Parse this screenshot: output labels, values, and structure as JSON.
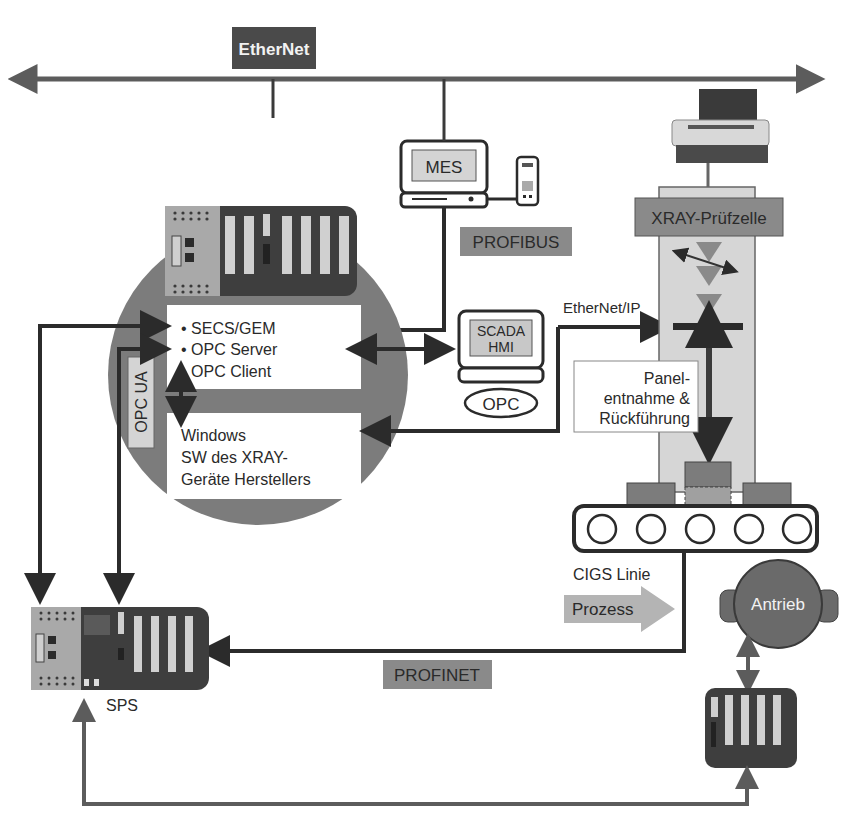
{
  "diagram": {
    "ethernet_label": "EtherNet",
    "mes_label": "MES",
    "profibus_label": "PROFIBUS",
    "xray_cell_label": "XRAY-Prüfzelle",
    "ethernet_ip_label": "EtherNet/IP",
    "scada_line1": "SCADA",
    "scada_line2": "HMI",
    "opc_label": "OPC",
    "opc_ua_label": "OPC UA",
    "software_items": [
      "• SECS/GEM",
      "• OPC Server",
      "• OPC Client"
    ],
    "windows_lines": [
      "Windows",
      "SW des XRAY-",
      "Geräte Herstellers"
    ],
    "panel_lines": [
      "Panel-",
      "entnahme &",
      "Rückführung"
    ],
    "cigs_label": "CIGS Linie",
    "prozess_label": "Prozess",
    "antrieb_label": "Antrieb",
    "profinet_label": "PROFINET",
    "sps_label": "SPS",
    "colors": {
      "dark_box": "#4a4a4a",
      "mid_gray": "#8a8a8a",
      "light_gray": "#d4d4d4",
      "line": "#2b2b2b",
      "circle": "#7c7c7c"
    }
  }
}
